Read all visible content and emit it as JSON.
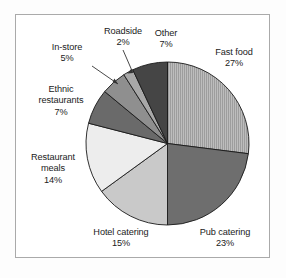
{
  "chart_data": {
    "type": "pie",
    "title": "",
    "subtitle": "",
    "xlabel": "",
    "ylabel": "",
    "units": "percent",
    "legend_position": "none",
    "grid": false,
    "labels_inline": true,
    "categories": [
      "Fast food",
      "Pub catering",
      "Hotel catering",
      "Restaurant meals",
      "Ethnic restaurants",
      "In-store",
      "Roadside",
      "Other"
    ],
    "values": [
      27,
      23,
      15,
      14,
      7,
      5,
      2,
      7
    ],
    "value_labels": [
      "27%",
      "23%",
      "15%",
      "14%",
      "7%",
      "5%",
      "2%",
      "7%"
    ],
    "total": 100,
    "slice_colors": [
      "#b4b4b4",
      "#6e6e6e",
      "#c9c9c9",
      "#ededed",
      "#6a6a6a",
      "#8f8f8f",
      "#a8a8a8",
      "#454545"
    ],
    "slices": [
      {
        "name": "Fast food",
        "value": 27,
        "value_label": "27%",
        "color": "#b4b4b4",
        "pattern": "vertical-hatch",
        "leader": false
      },
      {
        "name": "Pub catering",
        "value": 23,
        "value_label": "23%",
        "color": "#6e6e6e",
        "pattern": "solid",
        "leader": false
      },
      {
        "name": "Hotel catering",
        "value": 15,
        "value_label": "15%",
        "color": "#c9c9c9",
        "pattern": "solid",
        "leader": false
      },
      {
        "name": "Restaurant meals",
        "value": 14,
        "value_label": "14%",
        "color": "#ededed",
        "pattern": "solid",
        "leader": false
      },
      {
        "name": "Ethnic restaurants",
        "value": 7,
        "value_label": "7%",
        "color": "#6a6a6a",
        "pattern": "solid",
        "leader": false
      },
      {
        "name": "In-store",
        "value": 5,
        "value_label": "5%",
        "color": "#8f8f8f",
        "pattern": "solid",
        "leader": true
      },
      {
        "name": "Roadside",
        "value": 2,
        "value_label": "2%",
        "color": "#a8a8a8",
        "pattern": "solid",
        "leader": true
      },
      {
        "name": "Other",
        "value": 7,
        "value_label": "7%",
        "color": "#454545",
        "pattern": "solid",
        "leader": false
      }
    ],
    "start_angle_deg": 0,
    "direction": "clockwise"
  },
  "labels": {
    "fast_food": {
      "name": "Fast food",
      "value": "27%"
    },
    "pub_catering": {
      "name": "Pub catering",
      "value": "23%"
    },
    "hotel_catering": {
      "name": "Hotel catering",
      "value": "15%"
    },
    "restaurant_meals": {
      "name1": "Restaurant",
      "name2": "meals",
      "value": "14%"
    },
    "ethnic_restaurants": {
      "name1": "Ethnic",
      "name2": "restaurants",
      "value": "7%"
    },
    "in_store": {
      "name": "In-store",
      "value": "5%"
    },
    "roadside": {
      "name": "Roadside",
      "value": "2%"
    },
    "other": {
      "name": "Other",
      "value": "7%"
    }
  },
  "style": {
    "frame_border_color": "#aaaaaa",
    "background": "#ffffff",
    "text_color": "#1b1b1b",
    "slice_outline_color": "#1a1a1a",
    "leader_line_color": "#333333"
  }
}
